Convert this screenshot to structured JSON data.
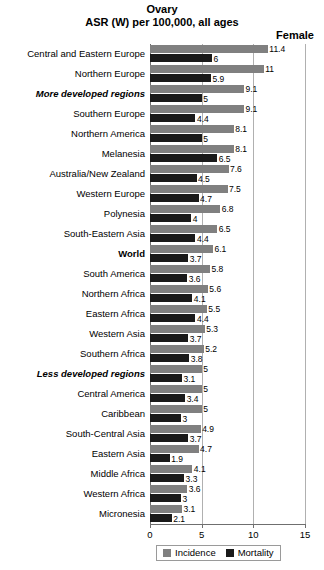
{
  "header": {
    "title": "Ovary",
    "subtitle": "ASR (W) per 100,000, all ages",
    "sex_label": "Female"
  },
  "legend": {
    "incidence_label": "Incidence",
    "mortality_label": "Mortality",
    "incidence_color": "#808080",
    "mortality_color": "#1a1a1a"
  },
  "chart_data": {
    "type": "bar",
    "orientation": "horizontal",
    "title": "Ovary",
    "subtitle": "ASR (W) per 100,000, all ages",
    "xlabel": "",
    "ylabel": "",
    "xlim": [
      0,
      15
    ],
    "xticks": [
      0,
      5,
      10,
      15
    ],
    "xtick_labels": [
      "0",
      "5",
      "10",
      "15"
    ],
    "grid": true,
    "legend_position": "bottom",
    "categories": [
      "Central and Eastern Europe",
      "Northern Europe",
      "More developed regions",
      "Southern Europe",
      "Northern America",
      "Melanesia",
      "Australia/New Zealand",
      "Western Europe",
      "Polynesia",
      "South-Eastern Asia",
      "World",
      "South America",
      "Northern Africa",
      "Eastern Africa",
      "Western Asia",
      "Southern Africa",
      "Less developed regions",
      "Central America",
      "Caribbean",
      "South-Central Asia",
      "Eastern Asia",
      "Middle Africa",
      "Western Africa",
      "Micronesia"
    ],
    "category_styles": [
      "normal",
      "normal",
      "bolditalic",
      "normal",
      "normal",
      "normal",
      "normal",
      "normal",
      "normal",
      "normal",
      "bold",
      "normal",
      "normal",
      "normal",
      "normal",
      "normal",
      "bolditalic",
      "normal",
      "normal",
      "normal",
      "normal",
      "normal",
      "normal",
      "normal"
    ],
    "series": [
      {
        "name": "Incidence",
        "color": "#808080",
        "values": [
          11.4,
          11,
          9.1,
          9.1,
          8.1,
          8.1,
          7.6,
          7.5,
          6.8,
          6.5,
          6.1,
          5.8,
          5.6,
          5.5,
          5.3,
          5.2,
          5,
          5,
          5,
          4.9,
          4.7,
          4.1,
          3.6,
          3.1
        ],
        "labels": [
          "11.4",
          "11",
          "9.1",
          "9.1",
          "8.1",
          "8.1",
          "7.6",
          "7.5",
          "6.8",
          "6.5",
          "6.1",
          "5.8",
          "5.6",
          "5.5",
          "5.3",
          "5.2",
          "5",
          "5",
          "5",
          "4.9",
          "4.7",
          "4.1",
          "3.6",
          "3.1"
        ]
      },
      {
        "name": "Mortality",
        "color": "#1a1a1a",
        "values": [
          6,
          5.9,
          5,
          4.4,
          5,
          6.5,
          4.5,
          4.7,
          4,
          4.4,
          3.7,
          3.6,
          4.1,
          4.4,
          3.7,
          3.8,
          3.1,
          3.4,
          3,
          3.7,
          1.9,
          3.3,
          3,
          2.1
        ],
        "labels": [
          "6",
          "5.9",
          "5",
          "4.4",
          "5",
          "6.5",
          "4.5",
          "4.7",
          "4",
          "4.4",
          "3.7",
          "3.6",
          "4.1",
          "4.4",
          "3.7",
          "3.8",
          "3.1",
          "3.4",
          "3",
          "3.7",
          "1.9",
          "3.3",
          "3",
          "2.1"
        ]
      }
    ]
  }
}
